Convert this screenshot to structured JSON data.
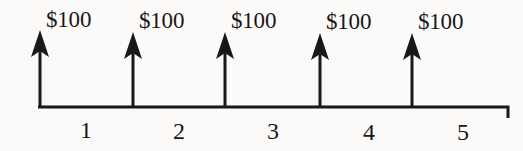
{
  "figure": {
    "type": "cash-flow-timeline",
    "background_color": "#fbfaf8",
    "ink_color": "#18171a",
    "axis": {
      "start_x": 38,
      "end_x": 508,
      "baseline_y": 107,
      "end_tick_height": 11,
      "stroke_width": 3
    },
    "arrows": [
      {
        "label": "$100",
        "period": 1,
        "x": 40,
        "tip_y": 30,
        "label_x": 46,
        "label_y": 8
      },
      {
        "label": "$100",
        "period": 2,
        "x": 133,
        "tip_y": 32,
        "label_x": 139,
        "label_y": 9
      },
      {
        "label": "$100",
        "period": 3,
        "x": 225,
        "tip_y": 32,
        "label_x": 231,
        "label_y": 9
      },
      {
        "label": "$100",
        "period": 4,
        "x": 320,
        "tip_y": 33,
        "label_x": 326,
        "label_y": 10
      },
      {
        "label": "$100",
        "period": 5,
        "x": 412,
        "tip_y": 33,
        "label_x": 418,
        "label_y": 10
      }
    ],
    "period_labels": [
      {
        "text": "1",
        "x": 85,
        "y": 118
      },
      {
        "text": "2",
        "x": 178,
        "y": 119
      },
      {
        "text": "3",
        "x": 272,
        "y": 119
      },
      {
        "text": "4",
        "x": 368,
        "y": 120
      },
      {
        "text": "5",
        "x": 462,
        "y": 120
      }
    ]
  },
  "chart_data": {
    "type": "bar",
    "title": "",
    "xlabel": "",
    "ylabel": "",
    "categories": [
      "1",
      "2",
      "3",
      "4",
      "5"
    ],
    "values": [
      100,
      100,
      100,
      100,
      100
    ],
    "value_labels": [
      "$100",
      "$100",
      "$100",
      "$100",
      "$100"
    ],
    "currency": "$",
    "direction": "inflow",
    "grid": false,
    "legend": "none"
  }
}
